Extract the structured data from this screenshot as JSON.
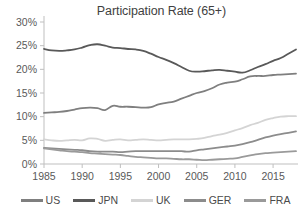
{
  "chart_data": {
    "type": "line",
    "title": "Participation Rate (65+)",
    "xlabel": "",
    "ylabel": "",
    "xlim": [
      1985,
      2018
    ],
    "ylim": [
      0,
      30
    ],
    "grid": false,
    "legend_position": "bottom",
    "x_ticks": [
      "1985",
      "1990",
      "1995",
      "2000",
      "2005",
      "2010",
      "2015"
    ],
    "x_tick_values": [
      1985,
      1990,
      1995,
      2000,
      2005,
      2010,
      2015
    ],
    "y_ticks": [
      "0%",
      "5%",
      "10%",
      "15%",
      "20%",
      "25%",
      "30%"
    ],
    "y_tick_values": [
      0,
      5,
      10,
      15,
      20,
      25,
      30
    ],
    "x": [
      1985,
      1986,
      1987,
      1988,
      1989,
      1990,
      1991,
      1992,
      1993,
      1994,
      1995,
      1996,
      1997,
      1998,
      1999,
      2000,
      2001,
      2002,
      2003,
      2004,
      2005,
      2006,
      2007,
      2008,
      2009,
      2010,
      2011,
      2012,
      2013,
      2014,
      2015,
      2016,
      2017,
      2018
    ],
    "series": [
      {
        "name": "US",
        "color": "#7f7f7f",
        "values": [
          10.8,
          10.9,
          11.0,
          11.2,
          11.5,
          11.8,
          11.9,
          11.8,
          11.4,
          12.3,
          12.1,
          12.1,
          12.0,
          11.9,
          12.0,
          12.6,
          12.9,
          13.2,
          13.8,
          14.4,
          15.0,
          15.4,
          16.0,
          16.8,
          17.2,
          17.4,
          17.9,
          18.5,
          18.6,
          18.6,
          18.8,
          18.9,
          19.0,
          19.1
        ]
      },
      {
        "name": "JPN",
        "color": "#595959",
        "values": [
          24.3,
          24.0,
          23.9,
          24.0,
          24.2,
          24.6,
          25.1,
          25.3,
          25.0,
          24.6,
          24.5,
          24.3,
          24.2,
          23.9,
          23.3,
          22.6,
          22.0,
          21.3,
          20.5,
          19.7,
          19.5,
          19.6,
          19.8,
          19.9,
          19.7,
          19.5,
          19.3,
          19.8,
          20.5,
          21.1,
          21.8,
          22.4,
          23.3,
          24.2
        ]
      },
      {
        "name": "UK",
        "color": "#d4d4d4",
        "values": [
          5.2,
          5.0,
          4.9,
          5.0,
          5.1,
          5.0,
          5.4,
          5.3,
          4.9,
          5.1,
          5.2,
          5.0,
          5.1,
          5.2,
          5.1,
          5.0,
          5.1,
          5.2,
          5.2,
          5.2,
          5.3,
          5.5,
          5.9,
          6.2,
          6.6,
          7.1,
          7.6,
          8.2,
          8.7,
          9.3,
          9.7,
          10.0,
          10.1,
          10.1
        ]
      },
      {
        "name": "GER",
        "color": "#8c8c8c",
        "values": [
          3.4,
          3.3,
          3.2,
          3.1,
          3.0,
          2.9,
          2.7,
          2.6,
          2.6,
          2.6,
          2.5,
          2.6,
          2.7,
          2.7,
          2.7,
          2.7,
          2.7,
          2.7,
          2.7,
          2.6,
          2.9,
          3.1,
          3.3,
          3.5,
          3.7,
          3.9,
          4.2,
          4.6,
          5.1,
          5.6,
          6.0,
          6.3,
          6.6,
          6.9
        ]
      },
      {
        "name": "FRA",
        "color": "#9a9a9a",
        "values": [
          3.3,
          3.1,
          2.9,
          2.7,
          2.6,
          2.5,
          2.3,
          2.2,
          2.1,
          2.0,
          1.9,
          1.7,
          1.5,
          1.4,
          1.3,
          1.2,
          1.2,
          1.1,
          1.0,
          1.0,
          0.9,
          0.8,
          0.9,
          1.0,
          1.1,
          1.2,
          1.5,
          1.8,
          2.1,
          2.3,
          2.4,
          2.5,
          2.6,
          2.7
        ]
      }
    ]
  },
  "legend": {
    "items": [
      {
        "label": "US"
      },
      {
        "label": "JPN"
      },
      {
        "label": "UK"
      },
      {
        "label": "GER"
      },
      {
        "label": "FRA"
      }
    ]
  }
}
